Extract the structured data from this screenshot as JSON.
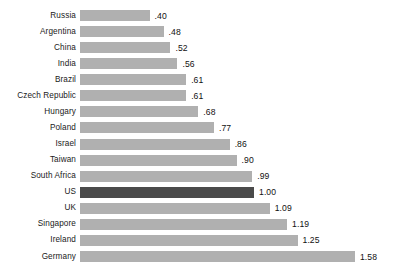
{
  "chart_data": {
    "type": "bar",
    "orientation": "horizontal",
    "title": "",
    "subtitle": "",
    "xlabel": "",
    "ylabel": "",
    "grid": false,
    "legend": null,
    "axis_visible": false,
    "tick_labels": [],
    "xlim": [
      0,
      1.58
    ],
    "baseline_category": "US",
    "baseline_value": "1.00",
    "colors": {
      "bar": "#b0b0b0",
      "bar_highlight": "#4a4a4a",
      "background": "#ffffff",
      "label_text": "#1a1a1a",
      "value_text": "#111111"
    },
    "categories": [
      "Russia",
      "Argentina",
      "China",
      "India",
      "Brazil",
      "Czech Republic",
      "Hungary",
      "Poland",
      "Israel",
      "Taiwan",
      "South Africa",
      "US",
      "UK",
      "Singapore",
      "Ireland",
      "Germany"
    ],
    "values": [
      0.4,
      0.48,
      0.52,
      0.56,
      0.61,
      0.61,
      0.68,
      0.77,
      0.86,
      0.9,
      0.99,
      1.0,
      1.09,
      1.19,
      1.25,
      1.58
    ],
    "value_labels": [
      ".40",
      ".48",
      ".52",
      ".56",
      ".61",
      ".61",
      ".68",
      ".77",
      ".86",
      ".90",
      ".99",
      "1.00",
      "1.09",
      "1.19",
      "1.25",
      "1.58"
    ],
    "highlighted": [
      false,
      false,
      false,
      false,
      false,
      false,
      false,
      false,
      false,
      false,
      false,
      true,
      false,
      false,
      false,
      false
    ],
    "rows": [
      {
        "category": "Russia",
        "value": 0.4,
        "value_label": ".40",
        "highlight": false
      },
      {
        "category": "Argentina",
        "value": 0.48,
        "value_label": ".48",
        "highlight": false
      },
      {
        "category": "China",
        "value": 0.52,
        "value_label": ".52",
        "highlight": false
      },
      {
        "category": "India",
        "value": 0.56,
        "value_label": ".56",
        "highlight": false
      },
      {
        "category": "Brazil",
        "value": 0.61,
        "value_label": ".61",
        "highlight": false
      },
      {
        "category": "Czech Republic",
        "value": 0.61,
        "value_label": ".61",
        "highlight": false
      },
      {
        "category": "Hungary",
        "value": 0.68,
        "value_label": ".68",
        "highlight": false
      },
      {
        "category": "Poland",
        "value": 0.77,
        "value_label": ".77",
        "highlight": false
      },
      {
        "category": "Israel",
        "value": 0.86,
        "value_label": ".86",
        "highlight": false
      },
      {
        "category": "Taiwan",
        "value": 0.9,
        "value_label": ".90",
        "highlight": false
      },
      {
        "category": "South Africa",
        "value": 0.99,
        "value_label": ".99",
        "highlight": false
      },
      {
        "category": "US",
        "value": 1.0,
        "value_label": "1.00",
        "highlight": true
      },
      {
        "category": "UK",
        "value": 1.09,
        "value_label": "1.09",
        "highlight": false
      },
      {
        "category": "Singapore",
        "value": 1.19,
        "value_label": "1.19",
        "highlight": false
      },
      {
        "category": "Ireland",
        "value": 1.25,
        "value_label": "1.25",
        "highlight": false
      },
      {
        "category": "Germany",
        "value": 1.58,
        "value_label": "1.58",
        "highlight": false
      }
    ]
  },
  "layout": {
    "bar_origin_x": 80,
    "px_per_unit": 174,
    "first_row_y": 10,
    "row_pitch": 16.07,
    "bar_height": 11,
    "value_gap": 5
  }
}
